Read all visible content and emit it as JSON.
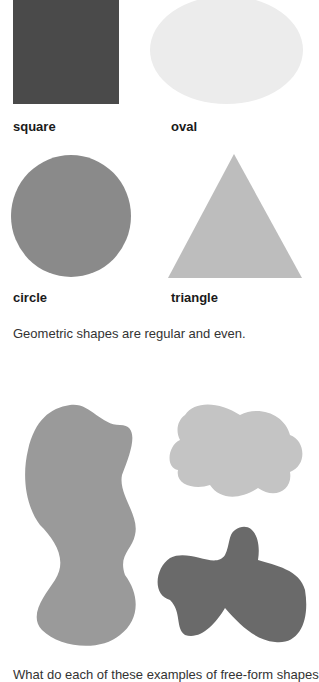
{
  "geometric": {
    "shapes": [
      {
        "name": "square",
        "label": "square",
        "color": "#4a4a4a"
      },
      {
        "name": "oval",
        "label": "oval",
        "color": "#ececec"
      },
      {
        "name": "circle",
        "label": "circle",
        "color": "#8a8a8a"
      },
      {
        "name": "triangle",
        "label": "triangle",
        "color": "#bdbdbd"
      }
    ],
    "caption": "Geometric shapes are regular and even."
  },
  "freeform": {
    "shapes": [
      {
        "name": "tall-blob",
        "color": "#9a9a9a"
      },
      {
        "name": "cloud",
        "color": "#c4c4c4"
      },
      {
        "name": "dark-blob",
        "color": "#6a6a6a"
      }
    ],
    "caption_clipped": "What do each of these examples of free-form shapes"
  }
}
